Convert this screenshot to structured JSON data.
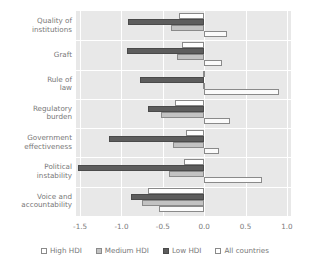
{
  "chart_data": {
    "type": "bar",
    "orientation": "horizontal",
    "title": "",
    "xlabel": "",
    "ylabel": "",
    "xlim": [
      -1.55,
      1.05
    ],
    "xticks": [
      "-1.5",
      "-1.0",
      "-0.5",
      "0.0",
      "0.5",
      "1.0"
    ],
    "xtick_values": [
      -1.5,
      -1.0,
      -0.5,
      0.0,
      0.5,
      1.0
    ],
    "grid": true,
    "legend_position": "bottom",
    "categories": [
      "Quality of institutions",
      "Graft",
      "Rule of law",
      "Regulatory burden",
      "Government effectiveness",
      "Political instability",
      "Voice and accountability"
    ],
    "category_lines": [
      [
        "Quality of",
        "institutions"
      ],
      [
        "Graft"
      ],
      [
        "Rule of",
        "law"
      ],
      [
        "Regulatory",
        "burden"
      ],
      [
        "Government",
        "effectiveness"
      ],
      [
        "Political",
        "instability"
      ],
      [
        "Voice and",
        "accountability"
      ]
    ],
    "series": [
      {
        "name": "High HDI",
        "color": "#ffffff",
        "values": [
          -0.3,
          -0.27,
          -0.01,
          -0.35,
          -0.22,
          -0.24,
          -0.68
        ]
      },
      {
        "name": "Medium HDI",
        "color": "#c2c2c2",
        "values": [
          -0.4,
          -0.33,
          -0.02,
          -0.52,
          -0.38,
          -0.42,
          -0.75
        ]
      },
      {
        "name": "Low HDI",
        "color": "#5d5d5d",
        "values": [
          -0.92,
          -0.93,
          -0.78,
          -0.68,
          -1.15,
          -1.52,
          -0.88
        ]
      },
      {
        "name": "All countries",
        "color": "#ffffff",
        "values": [
          0.28,
          0.22,
          0.9,
          0.31,
          0.18,
          0.7,
          -0.55
        ]
      }
    ]
  },
  "legend": {
    "items": [
      {
        "label": "High HDI",
        "key": "high"
      },
      {
        "label": "Medium HDI",
        "key": "medium"
      },
      {
        "label": "Low HDI",
        "key": "low"
      },
      {
        "label": "All countries",
        "key": "all"
      }
    ]
  },
  "colors": {
    "plot_background": "#e8e8e8",
    "gridline": "#ffffff",
    "text": "#787878",
    "bar_outline": "#8a8a8a"
  }
}
